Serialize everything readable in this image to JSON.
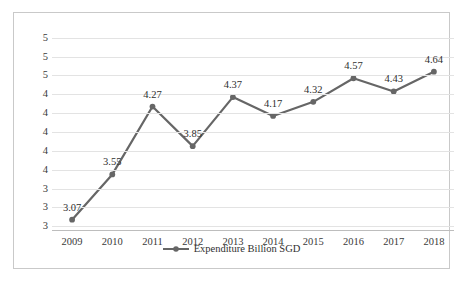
{
  "chart_data": {
    "type": "line",
    "title": "",
    "xlabel": "",
    "ylabel": "",
    "categories": [
      "2009",
      "2010",
      "2011",
      "2012",
      "2013",
      "2014",
      "2015",
      "2016",
      "2017",
      "2018"
    ],
    "series": [
      {
        "name": "Expenditure Billion SGD",
        "values": [
          3.07,
          3.55,
          4.27,
          3.85,
          4.37,
          4.17,
          4.32,
          4.57,
          4.43,
          4.64
        ],
        "color": "#666666",
        "marker": "circle"
      }
    ],
    "data_labels": [
      "3.07",
      "3.55",
      "4.27",
      "3.85",
      "4.37",
      "4.17",
      "4.32",
      "4.57",
      "4.43",
      "4.64"
    ],
    "ylim": [
      2.95,
      5.05
    ],
    "ytick_values": [
      5.0,
      4.8,
      4.6,
      4.4,
      4.2,
      4.0,
      3.8,
      3.6,
      3.4,
      3.2,
      3.0
    ],
    "ytick_labels": [
      "5",
      "5",
      "5",
      "4",
      "4",
      "4",
      "4",
      "4",
      "3",
      "3",
      "3"
    ],
    "grid": true,
    "grid_color": "#e3e3e3",
    "legend_position": "bottom",
    "legend_entries": [
      "Expenditure Billion SGD"
    ],
    "frame_border_color": "#c9c9c9",
    "background": "#ffffff",
    "axis_color": "#bdbdbd",
    "text_color": "#3a3a3a"
  }
}
